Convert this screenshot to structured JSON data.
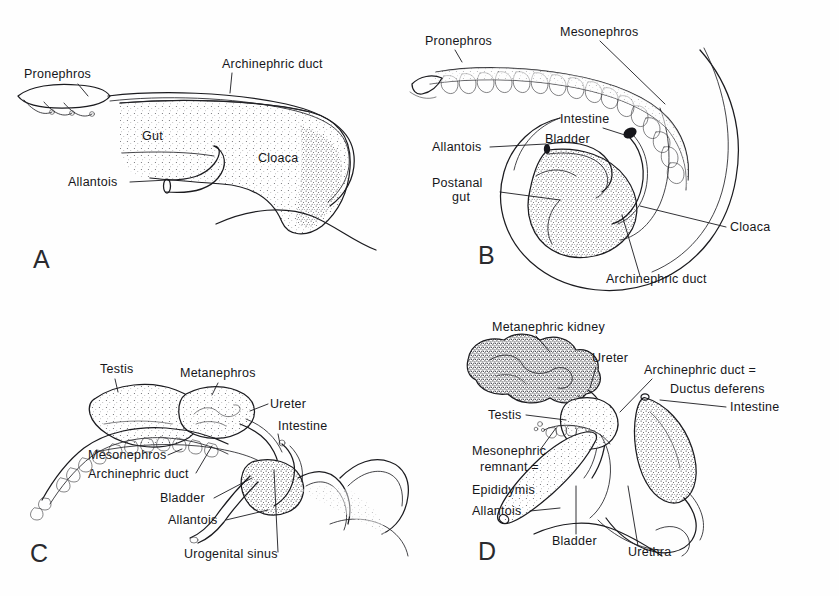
{
  "figure": {
    "background_color": "#fefefe",
    "ink_color": "#1b1b1f",
    "label_font_size_px": 12.5,
    "panel_count": 4
  },
  "panels": [
    {
      "letter": "A",
      "letter_pos": [
        33,
        268
      ],
      "stage": "early embryo - pronephros stage",
      "labels": [
        {
          "text": "Pronephros",
          "x": 24,
          "y": 78,
          "anchor": "start",
          "leader": [
            [
              78,
              84
            ],
            [
              88,
              96
            ]
          ]
        },
        {
          "text": "Archinephric duct",
          "x": 222,
          "y": 68,
          "anchor": "start",
          "leader": [
            [
              232,
              73
            ],
            [
              230,
              93
            ]
          ]
        },
        {
          "text": "Gut",
          "x": 142,
          "y": 140,
          "anchor": "start",
          "leader": null
        },
        {
          "text": "Cloaca",
          "x": 258,
          "y": 162,
          "anchor": "start",
          "leader": null
        },
        {
          "text": "Allantois",
          "x": 68,
          "y": 186,
          "anchor": "start",
          "leader": [
            [
              130,
              182
            ],
            [
              168,
              180
            ]
          ]
        }
      ]
    },
    {
      "letter": "B",
      "letter_pos": [
        478,
        264
      ],
      "stage": "later embryo - mesonephros and cloaca",
      "labels": [
        {
          "text": "Pronephros",
          "x": 425,
          "y": 45,
          "anchor": "start",
          "leader": [
            [
              455,
              50
            ],
            [
              462,
              62
            ]
          ]
        },
        {
          "text": "Mesonephros",
          "x": 560,
          "y": 36,
          "anchor": "start",
          "leader": [
            [
              600,
              41
            ],
            [
              665,
              104
            ]
          ]
        },
        {
          "text": "Intestine",
          "x": 560,
          "y": 123,
          "anchor": "start",
          "leader": [
            [
              603,
              128
            ],
            [
              628,
              136
            ]
          ]
        },
        {
          "text": "Bladder",
          "x": 545,
          "y": 143,
          "anchor": "start",
          "leader": null
        },
        {
          "text": "Allantois",
          "x": 432,
          "y": 151,
          "anchor": "start",
          "leader": [
            [
              490,
              147
            ],
            [
              546,
              144
            ]
          ]
        },
        {
          "text": "Postanal",
          "x": 432,
          "y": 187,
          "anchor": "start",
          "leader": [
            [
              500,
              192
            ],
            [
              560,
              200
            ]
          ]
        },
        {
          "text": "gut",
          "x": 452,
          "y": 201,
          "anchor": "start",
          "leader": null
        },
        {
          "text": "Cloaca",
          "x": 730,
          "y": 231,
          "anchor": "start",
          "leader": [
            [
              726,
              227
            ],
            [
              640,
              206
            ]
          ]
        },
        {
          "text": "Archinephric duct",
          "x": 606,
          "y": 283,
          "anchor": "start",
          "leader": [
            [
              640,
              276
            ],
            [
              622,
              215
            ]
          ]
        }
      ]
    },
    {
      "letter": "C",
      "letter_pos": [
        30,
        562
      ],
      "stage": "male amniote - metanephros forming",
      "labels": [
        {
          "text": "Testis",
          "x": 100,
          "y": 373,
          "anchor": "start",
          "leader": [
            [
              115,
              379
            ],
            [
              118,
              392
            ]
          ]
        },
        {
          "text": "Metanephros",
          "x": 180,
          "y": 377,
          "anchor": "start",
          "leader": [
            [
              218,
              383
            ],
            [
              212,
              395
            ]
          ]
        },
        {
          "text": "Ureter",
          "x": 270,
          "y": 408,
          "anchor": "start",
          "leader": [
            [
              268,
              404
            ],
            [
              250,
              411
            ]
          ]
        },
        {
          "text": "Intestine",
          "x": 278,
          "y": 430,
          "anchor": "start",
          "leader": [
            [
              278,
              434
            ],
            [
              280,
              444
            ]
          ]
        },
        {
          "text": "Mesonephros",
          "x": 88,
          "y": 459,
          "anchor": "start",
          "leader": [
            [
              168,
              455
            ],
            [
              182,
              449
            ]
          ]
        },
        {
          "text": "Archinephric duct",
          "x": 88,
          "y": 478,
          "anchor": "start",
          "leader": [
            [
              196,
              473
            ],
            [
              212,
              446
            ]
          ]
        },
        {
          "text": "Bladder",
          "x": 160,
          "y": 502,
          "anchor": "start",
          "leader": [
            [
              214,
              498
            ],
            [
              252,
              478
            ]
          ]
        },
        {
          "text": "Allantois",
          "x": 168,
          "y": 524,
          "anchor": "start",
          "leader": [
            [
              226,
              520
            ],
            [
              268,
              510
            ]
          ]
        },
        {
          "text": "Urogenital sinus",
          "x": 184,
          "y": 558,
          "anchor": "start",
          "leader": [
            [
              278,
              552
            ],
            [
              274,
              470
            ]
          ]
        }
      ]
    },
    {
      "letter": "D",
      "letter_pos": [
        478,
        560
      ],
      "stage": "adult male amniote",
      "labels": [
        {
          "text": "Metanephric  kidney",
          "x": 492,
          "y": 331,
          "anchor": "start",
          "leader": [
            [
              536,
              336
            ],
            [
              550,
              352
            ]
          ]
        },
        {
          "text": "Ureter",
          "x": 592,
          "y": 362,
          "anchor": "start",
          "leader": [
            [
              596,
              367
            ],
            [
              590,
              388
            ]
          ]
        },
        {
          "text": "Archinephric duct =",
          "x": 644,
          "y": 374,
          "anchor": "start",
          "leader": [
            [
              652,
              379
            ],
            [
              620,
              412
            ]
          ]
        },
        {
          "text": "Ductus deferens",
          "x": 670,
          "y": 393,
          "anchor": "start",
          "leader": null
        },
        {
          "text": "Intestine",
          "x": 730,
          "y": 411,
          "anchor": "start",
          "leader": [
            [
              726,
              407
            ],
            [
              660,
              400
            ]
          ]
        },
        {
          "text": "Testis",
          "x": 488,
          "y": 419,
          "anchor": "start",
          "leader": [
            [
              526,
              415
            ],
            [
              566,
              420
            ]
          ]
        },
        {
          "text": "Mesonephric",
          "x": 472,
          "y": 455,
          "anchor": "start",
          "leader": [
            [
              540,
              450
            ],
            [
              556,
              428
            ]
          ]
        },
        {
          "text": "remnant =",
          "x": 480,
          "y": 471,
          "anchor": "start",
          "leader": null
        },
        {
          "text": "Epididymis",
          "x": 472,
          "y": 494,
          "anchor": "start",
          "leader": null
        },
        {
          "text": "Allantois",
          "x": 472,
          "y": 515,
          "anchor": "start",
          "leader": [
            [
              530,
              511
            ],
            [
              560,
              508
            ]
          ]
        },
        {
          "text": "Bladder",
          "x": 552,
          "y": 545,
          "anchor": "start",
          "leader": [
            [
              576,
              534
            ],
            [
              576,
              486
            ]
          ]
        },
        {
          "text": "Urethra",
          "x": 628,
          "y": 556,
          "anchor": "start",
          "leader": [
            [
              638,
              546
            ],
            [
              628,
              486
            ]
          ]
        }
      ]
    }
  ],
  "structures_depicted": [
    "Pronephros",
    "Mesonephros",
    "Metanephros",
    "Metanephric kidney",
    "Archinephric duct",
    "Ductus deferens",
    "Ureter",
    "Urethra",
    "Gut",
    "Intestine",
    "Postanal gut",
    "Cloaca",
    "Urogenital sinus",
    "Bladder",
    "Allantois",
    "Testis",
    "Epididymis",
    "Mesonephric remnant"
  ]
}
